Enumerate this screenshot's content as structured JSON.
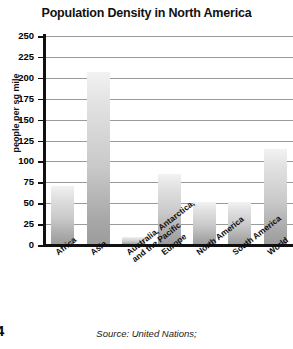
{
  "chart_data": {
    "type": "bar",
    "title": "Population Density in North America",
    "xlabel": "",
    "ylabel": "people per sq mile",
    "categories": [
      "Africa",
      "Asia",
      "Australia, Antarctica,\nand the Pacific",
      "Europe",
      "North America",
      "South America",
      "World"
    ],
    "values": [
      70,
      207,
      10,
      85,
      52,
      52,
      115
    ],
    "ylim": [
      0,
      250
    ],
    "yticks": [
      0,
      25,
      50,
      75,
      100,
      125,
      150,
      175,
      200,
      225,
      250
    ],
    "grid": true,
    "legend": "none",
    "series": [
      {
        "name": "people per sq mile",
        "values": [
          70,
          207,
          10,
          85,
          52,
          52,
          115
        ]
      }
    ]
  },
  "footer": {
    "source": "Source: United Nations;",
    "page_number": "4"
  },
  "colors": {
    "axis": "#111111",
    "gridline": "#9a9a9a",
    "bar_top": "#f2f2f2",
    "bar_bottom": "#9b9b9b",
    "text": "#000000"
  }
}
